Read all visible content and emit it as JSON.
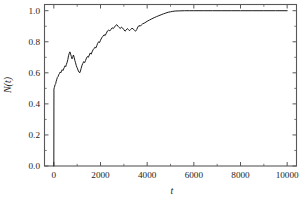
{
  "chart_data": {
    "type": "line",
    "title": "",
    "subtitle": "",
    "xlabel": "t",
    "ylabel": "N(t)",
    "xlim": [
      -400,
      10400
    ],
    "ylim": [
      0.0,
      1.04
    ],
    "xticks": [
      0,
      2000,
      4000,
      6000,
      8000,
      10000
    ],
    "xticklabels": [
      "0",
      "2000",
      "4000",
      "6000",
      "8000",
      "10000"
    ],
    "yticks": [
      0.0,
      0.2,
      0.4,
      0.6,
      0.8,
      1.0
    ],
    "yticklabels": [
      "0.0",
      "0.2",
      "0.4",
      "0.6",
      "0.8",
      "1.0"
    ],
    "x_minor_step": 1000,
    "y_minor_step": 0.1,
    "grid": false,
    "legend": null,
    "frame": "box",
    "tick_direction": "in",
    "line_color": "#1b1b1b",
    "axis_color": "#58585a",
    "background": "#ffffff",
    "annotations": [],
    "series": [
      {
        "name": "N(t)",
        "x": [
          0,
          5,
          20,
          40,
          60,
          80,
          100,
          120,
          150,
          180,
          210,
          240,
          270,
          300,
          330,
          360,
          390,
          420,
          450,
          480,
          510,
          540,
          570,
          600,
          630,
          660,
          690,
          720,
          750,
          780,
          810,
          840,
          870,
          900,
          930,
          960,
          990,
          1020,
          1050,
          1080,
          1110,
          1140,
          1170,
          1200,
          1240,
          1280,
          1320,
          1360,
          1400,
          1440,
          1480,
          1520,
          1560,
          1600,
          1640,
          1680,
          1720,
          1760,
          1800,
          1840,
          1880,
          1920,
          1960,
          2000,
          2050,
          2100,
          2150,
          2200,
          2250,
          2300,
          2350,
          2400,
          2450,
          2500,
          2550,
          2600,
          2650,
          2700,
          2750,
          2800,
          2850,
          2900,
          2950,
          3000,
          3050,
          3100,
          3150,
          3200,
          3250,
          3300,
          3350,
          3400,
          3450,
          3500,
          3550,
          3600,
          3650,
          3700,
          3750,
          3800,
          3900,
          4000,
          4100,
          4200,
          4300,
          4400,
          4500,
          4600,
          4700,
          4800,
          4900,
          5000,
          5100,
          5200,
          5400,
          5600,
          5800,
          6000,
          6400,
          6800,
          7200,
          7600,
          8000,
          8500,
          9000,
          9500,
          10000
        ],
        "y": [
          0.0,
          0.495,
          0.505,
          0.515,
          0.525,
          0.53,
          0.545,
          0.555,
          0.57,
          0.575,
          0.588,
          0.595,
          0.605,
          0.6,
          0.612,
          0.62,
          0.615,
          0.625,
          0.635,
          0.645,
          0.64,
          0.655,
          0.668,
          0.685,
          0.71,
          0.725,
          0.735,
          0.72,
          0.705,
          0.69,
          0.7,
          0.715,
          0.7,
          0.68,
          0.665,
          0.648,
          0.635,
          0.625,
          0.612,
          0.605,
          0.6,
          0.612,
          0.628,
          0.645,
          0.66,
          0.672,
          0.665,
          0.68,
          0.695,
          0.705,
          0.7,
          0.715,
          0.728,
          0.72,
          0.735,
          0.748,
          0.755,
          0.765,
          0.76,
          0.775,
          0.79,
          0.8,
          0.795,
          0.81,
          0.825,
          0.835,
          0.845,
          0.84,
          0.855,
          0.87,
          0.875,
          0.87,
          0.88,
          0.89,
          0.885,
          0.895,
          0.905,
          0.91,
          0.9,
          0.892,
          0.885,
          0.895,
          0.888,
          0.878,
          0.868,
          0.875,
          0.885,
          0.878,
          0.872,
          0.88,
          0.888,
          0.882,
          0.875,
          0.868,
          0.878,
          0.895,
          0.905,
          0.9,
          0.908,
          0.915,
          0.922,
          0.932,
          0.94,
          0.948,
          0.955,
          0.962,
          0.968,
          0.974,
          0.98,
          0.985,
          0.99,
          0.993,
          0.996,
          0.998,
          0.999,
          1.0,
          1.0,
          1.0,
          1.0,
          1.0,
          1.0,
          1.0,
          1.0,
          1.0,
          1.0,
          1.0,
          1.0
        ]
      }
    ]
  }
}
